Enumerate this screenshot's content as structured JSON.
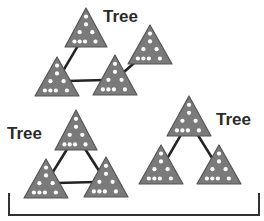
{
  "diagram": {
    "title": "",
    "colors": {
      "triangle_fill": "#7a7a7a",
      "triangle_stroke": "#555555",
      "dot": "#ffffff",
      "edge": "#222222",
      "bracket": "#333333",
      "label": "#2b2b2b"
    },
    "trees": [
      {
        "label": "Tree",
        "label_pos": {
          "x": 103,
          "y": 8
        },
        "nodes": [
          {
            "id": "t1n1",
            "apex": [
              86,
              8
            ],
            "half_width": 21,
            "base_y": 47
          },
          {
            "id": "t1n2",
            "apex": [
              57,
              57
            ],
            "half_width": 22,
            "base_y": 96
          },
          {
            "id": "t1n3",
            "apex": [
              115,
              55
            ],
            "half_width": 22,
            "base_y": 95
          },
          {
            "id": "t1n4",
            "apex": [
              150,
              25
            ],
            "half_width": 22,
            "base_y": 64
          }
        ],
        "edges": [
          [
            "t1n1",
            "t1n2"
          ],
          [
            "t1n2",
            "t1n3"
          ],
          [
            "t1n3",
            "t1n4"
          ]
        ]
      },
      {
        "label": "Tree",
        "label_pos": {
          "x": 7,
          "y": 125
        },
        "nodes": [
          {
            "id": "t2n1",
            "apex": [
              76,
              110
            ],
            "half_width": 21,
            "base_y": 150
          },
          {
            "id": "t2n2",
            "apex": [
              46,
              159
            ],
            "half_width": 22,
            "base_y": 198
          },
          {
            "id": "t2n3",
            "apex": [
              106,
              157
            ],
            "half_width": 22,
            "base_y": 197
          }
        ],
        "edges": [
          [
            "t2n1",
            "t2n2"
          ],
          [
            "t2n1",
            "t2n3"
          ],
          [
            "t2n2",
            "t2n3"
          ]
        ]
      },
      {
        "label": "Tree",
        "label_pos": {
          "x": 216,
          "y": 111
        },
        "nodes": [
          {
            "id": "t3n1",
            "apex": [
              189,
              96
            ],
            "half_width": 22,
            "base_y": 136
          },
          {
            "id": "t3n2",
            "apex": [
              161,
              145
            ],
            "half_width": 22,
            "base_y": 184
          },
          {
            "id": "t3n3",
            "apex": [
              219,
              145
            ],
            "half_width": 22,
            "base_y": 184
          }
        ],
        "edges": [
          [
            "t3n1",
            "t3n2"
          ],
          [
            "t3n1",
            "t3n3"
          ]
        ]
      }
    ],
    "bracket": {
      "left_x": 9,
      "right_x": 259,
      "top_y": 193,
      "bottom_y": 215
    }
  }
}
